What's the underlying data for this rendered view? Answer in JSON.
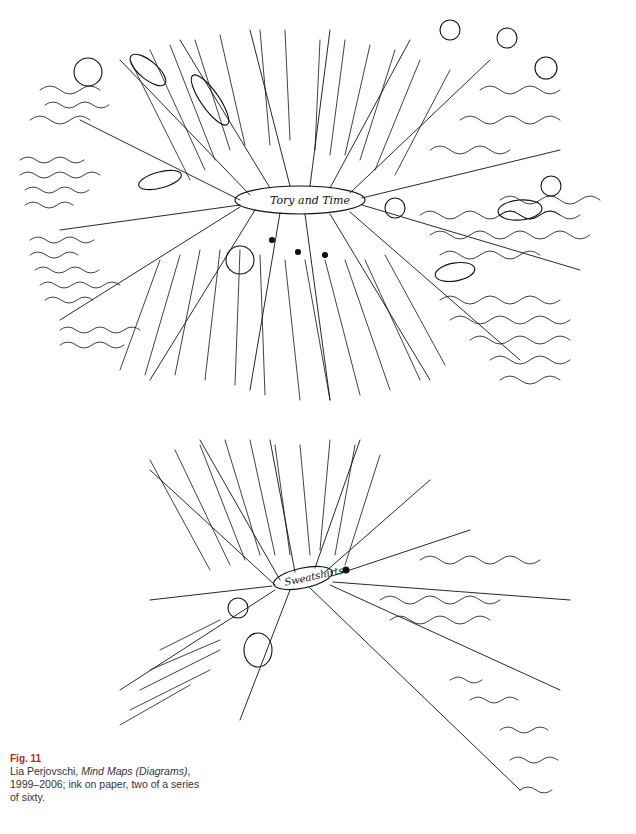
{
  "figure": {
    "number": "Fig. 11",
    "number_color": "#b0281e",
    "artist": "Lia Perjovschi,",
    "title": "Mind Maps (Diagrams)",
    "details": ", 1999–2006; ink on paper, two of a series of sixty."
  },
  "map_top": {
    "center_label": "Tory and Time",
    "nodes": [
      "reality",
      "capitalism",
      "Structuralism",
      "space and time",
      "absolute theories",
      "relationships",
      "Newton",
      "theory",
      "?",
      "2",
      "1"
    ],
    "fragments": [
      "space and time are made independently of objects and events",
      "if something were the only thing in the universe, it could move, or be at rest",
      "space & time are merely relations between objects & events"
    ]
  },
  "map_bottom": {
    "center_label": "Sweatshirts",
    "nodes": [
      "?",
      "UK",
      "Cred"
    ],
    "fragments": [
      "UK - fashion - white working class",
      "melee",
      "what the ..."
    ]
  }
}
